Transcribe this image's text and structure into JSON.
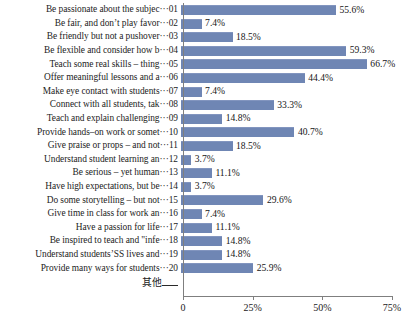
{
  "chart_data": {
    "type": "bar",
    "orientation": "horizontal",
    "title": "",
    "xlabel": "",
    "ylabel": "",
    "xlim": [
      0,
      75
    ],
    "xticks": [
      0,
      25,
      50,
      75
    ],
    "xtick_labels": [
      "0",
      "25%",
      "50%",
      "75%"
    ],
    "grid": false,
    "legend": null,
    "series_color": "#6f86b4",
    "value_suffix": "%",
    "categories": [
      "Be passionate about the subjec···01",
      "Be fair, and don’t play favor···02",
      "Be friendly but not a pushover···03",
      "Be flexible and consider how b···04",
      "Teach some real skills – thing···05",
      "Offer meaningful lessons and a···06",
      "Make eye contact with students···07",
      "Connect with all students, tak···08",
      "Teach and explain challenging···09",
      "Provide hands–on work or somet···10",
      "Give praise or props – and not···11",
      "Understand student learning an···12",
      "Be serious – yet human···13",
      "Have high expectations, but be···14",
      "Do some storytelling – but not···15",
      "Give time in class for work an···16",
      "Have a passion for life···17",
      "Be inspired to teach and \"infe···18",
      "Understand students’SS lives and···19",
      "Provide many ways for students···20"
    ],
    "values": [
      55.6,
      7.4,
      18.5,
      59.3,
      66.7,
      44.4,
      7.4,
      33.3,
      14.8,
      40.7,
      18.5,
      3.7,
      11.1,
      3.7,
      29.6,
      7.4,
      11.1,
      14.8,
      14.8,
      25.9
    ],
    "value_labels": [
      "55.6%",
      "7.4%",
      "18.5%",
      "59.3%",
      "66.7%",
      "44.4%",
      "7.4%",
      "33.3%",
      "14.8%",
      "40.7%",
      "18.5%",
      "3.7%",
      "11.1%",
      "3.7%",
      "29.6%",
      "7.4%",
      "11.1%",
      "14.8%",
      "14.8%",
      "25.9%"
    ]
  },
  "axis": {
    "other_row_label": "其他"
  }
}
